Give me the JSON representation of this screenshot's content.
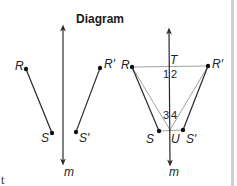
{
  "title": "Diagram",
  "fragment_text": "t",
  "left_figure": {
    "line_label": "m",
    "points": [
      {
        "name": "R",
        "label": "R"
      },
      {
        "name": "S",
        "label": "S"
      },
      {
        "name": "R-prime",
        "label": "R′"
      },
      {
        "name": "S-prime",
        "label": "S′"
      }
    ]
  },
  "right_figure": {
    "line_label": "m",
    "points": [
      {
        "name": "R",
        "label": "R"
      },
      {
        "name": "R-prime",
        "label": "R′"
      },
      {
        "name": "S",
        "label": "S"
      },
      {
        "name": "S-prime",
        "label": "S′"
      },
      {
        "name": "T",
        "label": "T"
      },
      {
        "name": "U",
        "label": "U"
      }
    ],
    "angles": [
      "1",
      "2",
      "3",
      "4"
    ]
  },
  "colors": {
    "line": "#2a2a2a",
    "thin_line": "#8a8a8a",
    "edge_bar": "#cfcfcf"
  }
}
